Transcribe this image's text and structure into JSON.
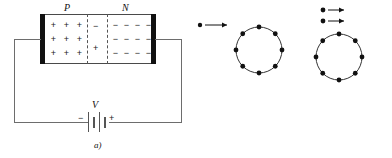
{
  "figure": {
    "panels": [
      {
        "id": "a",
        "caption": "a)",
        "name": "pn-junction-biased-circuit",
        "region_labels": {
          "p": "P",
          "n": "N"
        },
        "p_charges": [
          "+",
          "+",
          "+",
          "+",
          "+",
          "+",
          "+",
          "+",
          "+"
        ],
        "n_charges": [
          "−",
          "−",
          "−",
          "−",
          "−",
          "−",
          "−",
          "−",
          "−",
          "−",
          "−",
          "−"
        ],
        "depletion_charges": {
          "top": "−",
          "bottom": "+"
        },
        "battery": {
          "voltage_label": "V",
          "negative_terminal": "−",
          "positive_terminal": "+"
        }
      },
      {
        "id": "b",
        "caption": "b)",
        "name": "single-electron-approaching-ring",
        "ring_electron_count": 8,
        "incoming_electron_count": 1
      },
      {
        "id": "c",
        "caption": "c)",
        "name": "two-electrons-approaching-ring",
        "ring_electron_count": 8,
        "incoming_electron_count": 2
      }
    ]
  },
  "colors": {
    "ink": "#111111",
    "wire": "#6d6d6d",
    "electrode": "#111111",
    "dashed": "#555555",
    "background": "#ffffff"
  }
}
